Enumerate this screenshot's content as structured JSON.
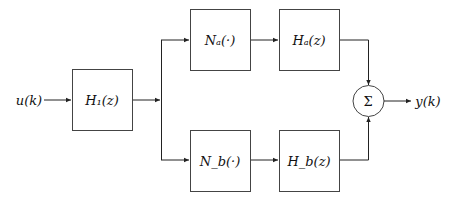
{
  "diagram": {
    "type": "block-diagram",
    "input_label": "u(k)",
    "output_label": "y(k)",
    "blocks": [
      {
        "id": "H1",
        "label": "H₁(z)"
      },
      {
        "id": "Na",
        "label": "Nₐ(·)"
      },
      {
        "id": "Ha",
        "label": "Hₐ(z)"
      },
      {
        "id": "Nb",
        "label": "N_b(·)"
      },
      {
        "id": "Hb",
        "label": "H_b(z)"
      }
    ],
    "summer_label": "Σ",
    "connections": [
      [
        "u(k)",
        "H1"
      ],
      [
        "H1",
        "Na"
      ],
      [
        "H1",
        "Nb"
      ],
      [
        "Na",
        "Ha"
      ],
      [
        "Nb",
        "Hb"
      ],
      [
        "Ha",
        "Σ"
      ],
      [
        "Hb",
        "Σ"
      ],
      [
        "Σ",
        "y(k)"
      ]
    ]
  }
}
